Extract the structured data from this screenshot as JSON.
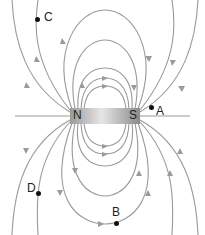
{
  "diagram": {
    "magnet": {
      "north_label": "N",
      "south_label": "S"
    },
    "points": [
      {
        "id": "C",
        "label": "C",
        "x": 37,
        "y": 20
      },
      {
        "id": "A",
        "label": "A",
        "x": 151,
        "y": 107
      },
      {
        "id": "D",
        "label": "D",
        "x": 37,
        "y": 193
      },
      {
        "id": "B",
        "label": "B",
        "x": 116,
        "y": 223
      }
    ],
    "colors": {
      "field_line": "#9a9a9a",
      "magnet_light": "#d8d8d8",
      "magnet_dark": "#8c8c8c",
      "point": "#111111"
    }
  }
}
